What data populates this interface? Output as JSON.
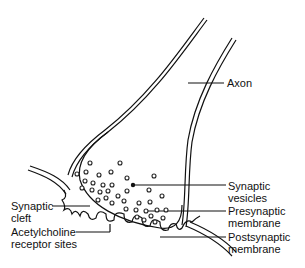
{
  "diagram": {
    "labels": {
      "axon": "Axon",
      "synaptic_vesicles_1": "Synaptic",
      "synaptic_vesicles_2": "vesicles",
      "presynaptic_1": "Presynaptic",
      "presynaptic_2": "membrane",
      "postsynaptic_1": "Postsynaptic",
      "postsynaptic_2": "membrane",
      "cleft_1": "Synaptic",
      "cleft_2": "cleft",
      "receptor_1": "Acetylcholine",
      "receptor_2": "receptor sites"
    }
  }
}
